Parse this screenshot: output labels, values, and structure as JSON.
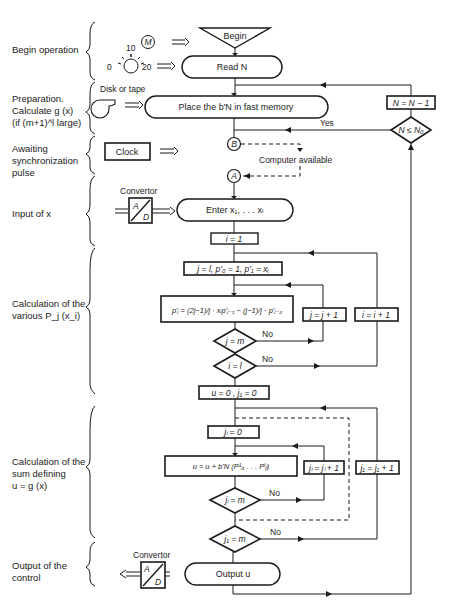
{
  "phases": [
    {
      "id": "begin",
      "label": "Begin operation"
    },
    {
      "id": "prep",
      "label": "Preparation.\nCalculate  g (x)\n(if (m+1)^l large)"
    },
    {
      "id": "sync",
      "label": "Awaiting\nsynchronization\npulse"
    },
    {
      "id": "input",
      "label": "Input of  x"
    },
    {
      "id": "calcP",
      "label": "Calculation of the\nvarious  P_j (x_i)"
    },
    {
      "id": "calcSum",
      "label": "Calculation of the\nsum defining\nu = g (x)"
    },
    {
      "id": "output",
      "label": "Output of the\ncontrol"
    }
  ],
  "devices": {
    "motor": "M",
    "dial_ticks": [
      "0",
      "10",
      "20"
    ],
    "disk_label": "Disk or tape",
    "clock": "Clock",
    "convertor_in": {
      "title": "Convertor",
      "top": "A",
      "bottom": "D"
    },
    "convertor_out": {
      "title": "Convertor",
      "top": "A",
      "bottom": "D"
    }
  },
  "nodes": {
    "begin": "Begin",
    "read_n": "Read N",
    "place": "Place the b'N  in fast memory",
    "n_dec": "N = N − 1",
    "n_cmp": "N ≤ N₀",
    "yes": "Yes",
    "connector_b": "B",
    "connector_a": "A",
    "computer_available": "Computer available",
    "enter": "Enter x₁, . . . xₗ",
    "i_init": "i = 1",
    "j_init": "j = l, p'₀ = 1, p'₁ = xᵢ",
    "recur": "p'ⱼ = (2j−1)/j · xᵢp'ⱼ₋₁ − (j−1)/j · p'ⱼ₋₂",
    "j_inc": "j = j + 1",
    "i_inc": "i = i + 1",
    "j_cmp": "j = m",
    "i_cmp": "i = l",
    "no1": "No",
    "no2": "No",
    "u_init": "u = 0 , j₁ = 0",
    "jl_init": "jₗ = 0",
    "sum": "u = u + b'N (P¹ⱼ₁ . . . Pˡⱼₗ)",
    "jl_inc": "jₗ = jₗ + 1",
    "j1_inc": "j₁ = j₁ + 1",
    "jl_cmp": "jₗ = m",
    "j1_cmp": "j₁ = m",
    "no3": "No",
    "no4": "No",
    "output": "Output u"
  }
}
